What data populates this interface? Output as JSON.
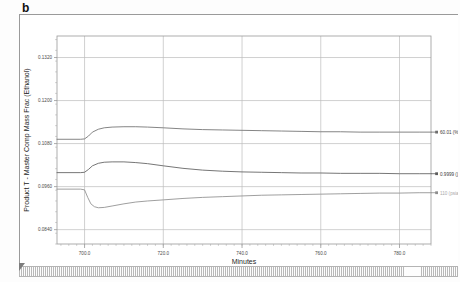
{
  "panel": {
    "label": "b"
  },
  "chart_data": {
    "type": "line",
    "title": "",
    "xlabel": "Minutes",
    "ylabel": "Product T - Master Comp Mass Frac (Ethanol)",
    "xlim": [
      693.0,
      788.0
    ],
    "ylim": [
      0.08,
      0.138
    ],
    "xticks": [
      "700.0",
      "720.0",
      "740.0",
      "760.0",
      "780.0"
    ],
    "xtick_values": [
      700.0,
      720.0,
      740.0,
      760.0,
      780.0
    ],
    "yticks": [
      "0.1320",
      "0.1200",
      "0.1080",
      "0.0960",
      "0.0840"
    ],
    "ytick_values": [
      0.132,
      0.12,
      0.108,
      0.096,
      0.084
    ],
    "grid": true,
    "legend_position": "right",
    "series": [
      {
        "name": "60.01 (%)",
        "color": "#6f6f6f",
        "x": [
          693.0,
          699.0,
          700.0,
          701.0,
          702.0,
          703.5,
          705.0,
          707.0,
          710.0,
          713.0,
          716.0,
          720.0,
          725.0,
          730.0,
          735.0,
          740.0,
          745.0,
          750.0,
          755.0,
          760.0,
          765.0,
          770.0,
          775.0,
          780.0,
          785.0,
          788.0
        ],
        "y": [
          0.1092,
          0.1092,
          0.1093,
          0.1101,
          0.1112,
          0.112,
          0.1124,
          0.1126,
          0.1127,
          0.1127,
          0.1126,
          0.1124,
          0.1121,
          0.1119,
          0.1118,
          0.1117,
          0.1116,
          0.1115,
          0.1114,
          0.1113,
          0.1113,
          0.1112,
          0.1112,
          0.1112,
          0.1112,
          0.1112
        ]
      },
      {
        "name": "0.9999 ()",
        "color": "#5d5d5d",
        "x": [
          693.0,
          699.0,
          700.0,
          701.0,
          702.0,
          703.5,
          705.0,
          707.0,
          710.0,
          713.0,
          716.0,
          720.0,
          725.0,
          730.0,
          735.0,
          740.0,
          745.0,
          750.0,
          755.0,
          760.0,
          765.0,
          770.0,
          775.0,
          780.0,
          785.0,
          788.0
        ],
        "y": [
          0.0999,
          0.0999,
          0.1,
          0.1008,
          0.1018,
          0.1025,
          0.1028,
          0.1029,
          0.1029,
          0.1027,
          0.1024,
          0.1018,
          0.1011,
          0.1006,
          0.1003,
          0.1001,
          0.1,
          0.0999,
          0.0998,
          0.0998,
          0.0997,
          0.0997,
          0.0997,
          0.0996,
          0.0996,
          0.0996
        ]
      },
      {
        "name": "110 (psia)",
        "color": "#8e8e8e",
        "x": [
          693.0,
          699.0,
          700.0,
          700.8,
          701.6,
          702.5,
          703.5,
          705.0,
          707.0,
          710.0,
          713.0,
          716.0,
          720.0,
          725.0,
          730.0,
          735.0,
          740.0,
          745.0,
          750.0,
          755.0,
          760.0,
          765.0,
          770.0,
          775.0,
          780.0,
          785.0,
          788.0
        ],
        "y": [
          0.0953,
          0.0953,
          0.0951,
          0.093,
          0.0912,
          0.0904,
          0.0901,
          0.0902,
          0.0906,
          0.0912,
          0.0917,
          0.092,
          0.0923,
          0.0927,
          0.093,
          0.0932,
          0.0934,
          0.0936,
          0.0937,
          0.0938,
          0.0939,
          0.094,
          0.0941,
          0.0942,
          0.0942,
          0.0943,
          0.0943
        ]
      }
    ]
  }
}
